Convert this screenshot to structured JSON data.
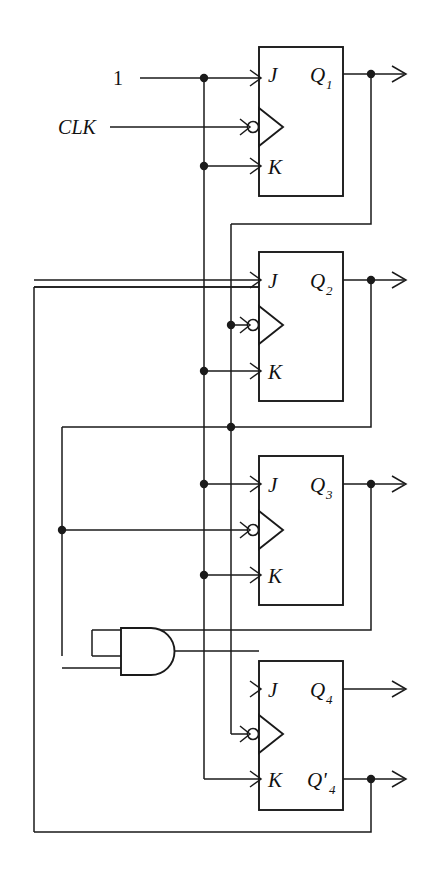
{
  "diagram": {
    "inputs": [
      {
        "name": "logic-one",
        "label": "1",
        "x": 118,
        "y": 78
      },
      {
        "name": "clock",
        "label": "CLK",
        "x": 77,
        "y": 127
      }
    ],
    "flipflops": [
      {
        "id": "ff1",
        "j_label": "J",
        "k_label": "K",
        "q_label": "Q",
        "q_sub": "1",
        "qn_label": "",
        "qn_sub": "",
        "box": {
          "x": 259,
          "y": 47,
          "w": 84,
          "h": 149
        },
        "j_y": 74,
        "clk_y": 121,
        "k_y": 166,
        "q_y": 74,
        "qn_y": 0
      },
      {
        "id": "ff2",
        "j_label": "J",
        "k_label": "K",
        "q_label": "Q",
        "q_sub": "2",
        "qn_label": "",
        "qn_sub": "",
        "box": {
          "x": 259,
          "y": 252,
          "w": 84,
          "h": 149
        },
        "j_y": 280,
        "clk_y": 325,
        "k_y": 371,
        "q_y": 280,
        "qn_y": 0
      },
      {
        "id": "ff3",
        "j_label": "J",
        "k_label": "K",
        "q_label": "Q",
        "q_sub": "3",
        "qn_label": "",
        "qn_sub": "",
        "box": {
          "x": 259,
          "y": 456,
          "w": 84,
          "h": 149
        },
        "j_y": 484,
        "clk_y": 530,
        "k_y": 575,
        "q_y": 484,
        "qn_y": 0
      },
      {
        "id": "ff4",
        "j_label": "J",
        "k_label": "K",
        "q_label": "Q",
        "q_sub": "4",
        "qn_label": "Q'",
        "qn_sub": "4",
        "box": {
          "x": 259,
          "y": 661,
          "w": 84,
          "h": 149
        },
        "j_y": 689,
        "clk_y": 734,
        "k_y": 779,
        "q_y": 689,
        "qn_y": 779
      }
    ],
    "gates": [
      {
        "id": "and1",
        "name": "and-gate",
        "type": "AND",
        "inputs": 2,
        "x": 121,
        "y": 628,
        "w": 60,
        "h": 47
      }
    ],
    "outputs": [
      {
        "name": "q1-out",
        "from": "Q1",
        "y": 74
      },
      {
        "name": "q2-out",
        "from": "Q2",
        "y": 280
      },
      {
        "name": "q3-out",
        "from": "Q3",
        "y": 484
      },
      {
        "name": "q4-out",
        "from": "Q4",
        "y": 689
      },
      {
        "name": "q4n-out",
        "from": "Q'4",
        "y": 779
      }
    ],
    "buses": [
      {
        "name": "logic-one-bus",
        "x": 204,
        "desc": "constant 1 vertical bus"
      },
      {
        "name": "q1-feedback-bus",
        "x": 231,
        "desc": "Q1 feedback vertical bus"
      },
      {
        "name": "outer-left-bus",
        "x": 34,
        "desc": "Q'4 global feedback"
      },
      {
        "name": "inner-left-bus",
        "x": 62,
        "desc": "Q2 feedback to FF3 clock"
      },
      {
        "name": "and-input-bus",
        "x": 92,
        "desc": "Q3 feedback to AND input"
      }
    ],
    "colors": {
      "ink": "#1a1a1a",
      "background": "#ffffff"
    }
  }
}
